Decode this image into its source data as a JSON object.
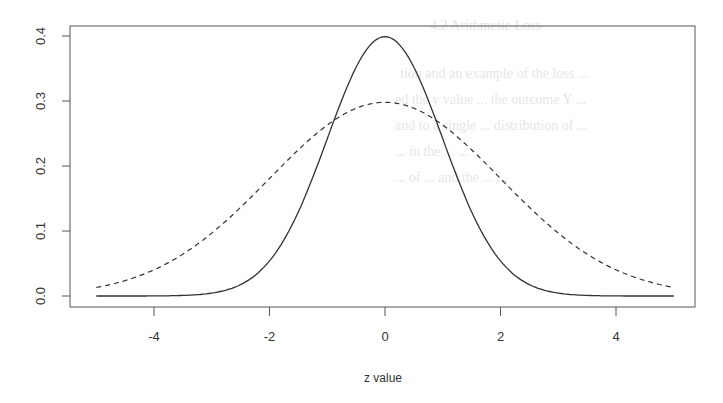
{
  "chart_data": {
    "type": "line",
    "title": "",
    "xlabel": "z value",
    "ylabel": "",
    "xlim": [
      -5,
      5
    ],
    "ylim": [
      0,
      0.4
    ],
    "x_ticks": [
      -4,
      -2,
      0,
      2,
      4
    ],
    "x_tick_labels": [
      "-4",
      "-2",
      "0",
      "2",
      "4"
    ],
    "y_ticks": [
      0.0,
      0.1,
      0.2,
      0.3,
      0.4
    ],
    "y_tick_labels": [
      "0.0",
      "0.1",
      "0.2",
      "0.3",
      "0.4"
    ],
    "grid": false,
    "legend": null,
    "x": [
      -5,
      -4,
      -3,
      -2,
      -1,
      0,
      1,
      2,
      3,
      4,
      5
    ],
    "series": [
      {
        "name": "solid",
        "style": "solid",
        "color": "#333333",
        "values": [
          0.0,
          0.0001,
          0.0044,
          0.054,
          0.242,
          0.3989,
          0.242,
          0.054,
          0.0044,
          0.0001,
          0.0
        ]
      },
      {
        "name": "dashed",
        "style": "dashed",
        "color": "#333333",
        "values": [
          0.013,
          0.04,
          0.097,
          0.181,
          0.263,
          0.298,
          0.263,
          0.181,
          0.097,
          0.04,
          0.013
        ]
      }
    ]
  },
  "labels": {
    "xlabel": "z value"
  }
}
